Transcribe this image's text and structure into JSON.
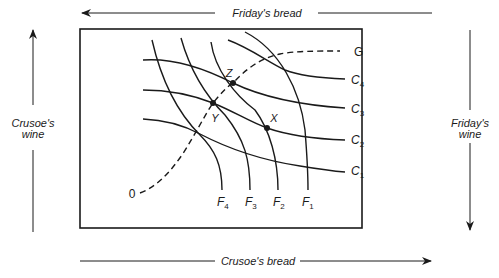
{
  "diagram": {
    "type": "edgeworth-box",
    "axes": {
      "top": {
        "label": "Friday's bread",
        "direction": "left"
      },
      "bottom": {
        "label": "Crusoe's bread",
        "direction": "right"
      },
      "left": {
        "label_line1": "Crusoe's",
        "label_line2": "wine",
        "direction": "up"
      },
      "right": {
        "label_line1": "Friday's",
        "label_line2": "wine",
        "direction": "down"
      }
    },
    "crusoe_indifference_curves": [
      {
        "name": "C",
        "sub": "1"
      },
      {
        "name": "C",
        "sub": "2"
      },
      {
        "name": "C",
        "sub": "3"
      },
      {
        "name": "C",
        "sub": "4"
      }
    ],
    "friday_indifference_curves": [
      {
        "name": "F",
        "sub": "1"
      },
      {
        "name": "F",
        "sub": "2"
      },
      {
        "name": "F",
        "sub": "3"
      },
      {
        "name": "F",
        "sub": "4"
      }
    ],
    "contract_curve": {
      "start_label": "0",
      "end_label": "G",
      "style": "dashed"
    },
    "points": [
      {
        "label": "Z"
      },
      {
        "label": "Y"
      },
      {
        "label": "X"
      }
    ],
    "colors": {
      "ink": "#1a1a1a",
      "background": "#ffffff"
    }
  }
}
